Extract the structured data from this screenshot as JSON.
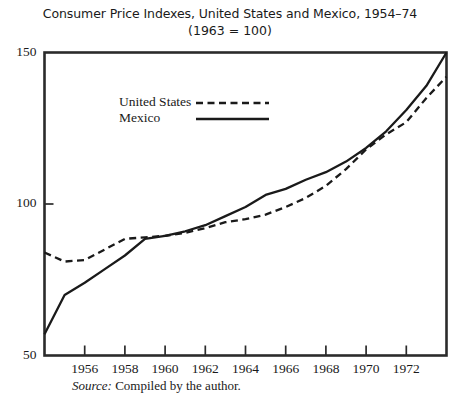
{
  "chart_data": {
    "type": "line",
    "title": "Consumer Price Indexes, United States and Mexico, 1954–74",
    "subtitle": "(1963 = 100)",
    "xlabel": "",
    "ylabel": "",
    "xlim": [
      1954,
      1974
    ],
    "ylim": [
      50,
      150
    ],
    "grid": false,
    "legend_position": "upper-left-inside",
    "y_ticks": [
      50,
      100,
      150
    ],
    "y_tick_labels": [
      "50",
      "100",
      "150"
    ],
    "x_ticks": [
      1956,
      1958,
      1960,
      1962,
      1964,
      1966,
      1968,
      1970,
      1972
    ],
    "x_tick_labels": [
      "1956",
      "1958",
      "1960",
      "1962",
      "1964",
      "1966",
      "1968",
      "1970",
      "1972"
    ],
    "x": [
      1954,
      1955,
      1956,
      1957,
      1958,
      1959,
      1960,
      1961,
      1962,
      1963,
      1964,
      1965,
      1966,
      1967,
      1968,
      1969,
      1970,
      1971,
      1972,
      1973,
      1974
    ],
    "series": [
      {
        "name": "United States",
        "style": "dashed",
        "color": "#1a1a1a",
        "values": [
          84,
          81,
          81.5,
          85,
          88.5,
          89,
          89.5,
          90.5,
          92,
          94,
          95,
          96.5,
          99,
          102,
          106,
          111.5,
          118,
          123,
          127,
          135,
          142
        ]
      },
      {
        "name": "Mexico",
        "style": "solid",
        "color": "#1a1a1a",
        "values": [
          57,
          70,
          74,
          78.5,
          83,
          88.5,
          89.5,
          91,
          93,
          96,
          99,
          103,
          105,
          108,
          110.5,
          114,
          118.5,
          124,
          131,
          139,
          150
        ]
      }
    ],
    "legend": [
      {
        "label": "United States",
        "style": "dashed"
      },
      {
        "label": "Mexico",
        "style": "solid"
      }
    ],
    "source_prefix": "Source:",
    "source_text": "Compiled by the author."
  }
}
